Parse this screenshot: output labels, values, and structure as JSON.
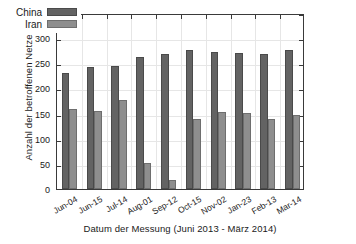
{
  "chart_data": {
    "type": "bar",
    "title": "",
    "xlabel": "Datum der Messung (Juni 2013 - März 2014)",
    "ylabel": "Anzahl der betroffenen Netze",
    "categories": [
      "Jun-04",
      "Jun-15",
      "Jul-14",
      "Aug-01",
      "Sep-12",
      "Oct-15",
      "Nov-02",
      "Jan-23",
      "Feb-13",
      "Mar-14"
    ],
    "series": [
      {
        "name": "China",
        "color": "#636363",
        "values": [
          230,
          242,
          245,
          263,
          268,
          277,
          272,
          271,
          268,
          277
        ]
      },
      {
        "name": "Iran",
        "color": "#8e8e8e",
        "values": [
          160,
          156,
          178,
          52,
          18,
          139,
          154,
          151,
          139,
          148
        ]
      }
    ],
    "ylim": [
      0,
      350
    ],
    "yticks": [
      0,
      50,
      100,
      150,
      200,
      250,
      300,
      350
    ],
    "ytick_labels": [
      "0",
      "50",
      "100",
      "150",
      "200",
      "250",
      "300",
      "350"
    ],
    "grid": true,
    "legend_position": "top-left"
  },
  "legend": {
    "entries": [
      {
        "label": "China"
      },
      {
        "label": "Iran"
      }
    ]
  }
}
